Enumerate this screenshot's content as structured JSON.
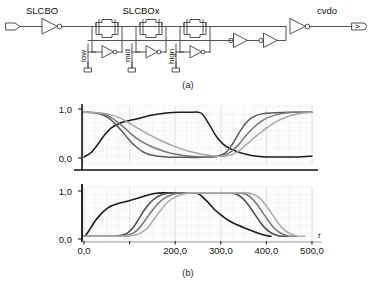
{
  "figure": {
    "panels": [
      {
        "id": "a",
        "caption": "(a)",
        "kind": "circuit-schematic"
      },
      {
        "id": "b",
        "caption": "(b)",
        "kind": "waveform-plots"
      }
    ]
  },
  "circuit": {
    "input_port_label": "SLCBO",
    "internal_net_label": "SLCBOx",
    "output_port_label": "cvdo",
    "control_labels": [
      "low",
      "mid",
      "hign"
    ],
    "stage_count": 3,
    "colors": {
      "wire": "#3a3a3a",
      "symbol": "#4a4a4a",
      "text": "#111111"
    }
  },
  "chart_data": [
    {
      "id": "top",
      "type": "line",
      "title": "",
      "xlabel": "",
      "ylabel": "",
      "xlim": [
        0,
        500
      ],
      "ylim": [
        -0.15,
        1.25
      ],
      "ytick_labels": [
        "1,0",
        "0,0"
      ],
      "ytick_values": [
        1.0,
        0.0
      ],
      "xtick_values": [
        0,
        100,
        200,
        300,
        400,
        500
      ],
      "grid": true,
      "legend": "none",
      "series": [
        {
          "name": "slcbo",
          "color": "#1c1c1c",
          "x": [
            0,
            15,
            30,
            45,
            60,
            80,
            100,
            120,
            150,
            180,
            210,
            240,
            250,
            260,
            275,
            290,
            305,
            320,
            335,
            350,
            370,
            400,
            430,
            470,
            500
          ],
          "y": [
            0.02,
            0.12,
            0.32,
            0.55,
            0.72,
            0.84,
            0.9,
            0.95,
            1.03,
            1.08,
            1.1,
            1.1,
            1.1,
            1.05,
            0.8,
            0.52,
            0.33,
            0.22,
            0.15,
            0.1,
            0.05,
            0.02,
            0.02,
            0.02,
            0.04
          ]
        },
        {
          "name": "cvdo-fast",
          "color": "#595959",
          "x": [
            0,
            20,
            40,
            55,
            70,
            85,
            100,
            115,
            130,
            150,
            180,
            220,
            260,
            290,
            310,
            325,
            340,
            355,
            370,
            390,
            420,
            460,
            500
          ],
          "y": [
            1.1,
            1.09,
            1.04,
            0.95,
            0.8,
            0.62,
            0.42,
            0.26,
            0.14,
            0.06,
            0.02,
            0.01,
            0.01,
            0.03,
            0.12,
            0.32,
            0.6,
            0.84,
            0.98,
            1.06,
            1.09,
            1.1,
            1.1
          ]
        },
        {
          "name": "cvdo-mid",
          "color": "#767676",
          "x": [
            0,
            25,
            45,
            60,
            75,
            90,
            105,
            125,
            150,
            175,
            205,
            240,
            275,
            300,
            320,
            340,
            355,
            372,
            390,
            410,
            440,
            470,
            500
          ],
          "y": [
            1.1,
            1.09,
            1.05,
            0.97,
            0.85,
            0.71,
            0.56,
            0.4,
            0.26,
            0.16,
            0.08,
            0.03,
            0.02,
            0.04,
            0.13,
            0.33,
            0.53,
            0.73,
            0.89,
            1.0,
            1.08,
            1.1,
            1.1
          ]
        },
        {
          "name": "cvdo-slow",
          "color": "#a6a6a6",
          "x": [
            0,
            30,
            50,
            70,
            88,
            105,
            125,
            148,
            172,
            200,
            230,
            262,
            292,
            315,
            335,
            355,
            375,
            398,
            420,
            445,
            472,
            500
          ],
          "y": [
            1.1,
            1.09,
            1.06,
            1.0,
            0.91,
            0.8,
            0.67,
            0.53,
            0.4,
            0.27,
            0.16,
            0.08,
            0.04,
            0.05,
            0.13,
            0.31,
            0.5,
            0.7,
            0.86,
            0.99,
            1.07,
            1.1
          ]
        }
      ]
    },
    {
      "id": "bottom",
      "type": "line",
      "title": "",
      "xlabel": "t",
      "ylabel": "",
      "xlim": [
        0,
        500
      ],
      "ylim": [
        -0.12,
        1.25
      ],
      "ytick_labels": [
        "1,0",
        "0,0"
      ],
      "ytick_values": [
        1.0,
        0.0
      ],
      "xtick_values": [
        0,
        100,
        200,
        300,
        400,
        500
      ],
      "xtick_labels": [
        "0,0",
        "",
        "200,0",
        "300,0",
        "400,0",
        "500,0"
      ],
      "grid": true,
      "legend": "none",
      "series": [
        {
          "name": "slcbo",
          "color": "#1c1c1c",
          "x": [
            0,
            6,
            14,
            24,
            36,
            50,
            62,
            75,
            92,
            110,
            128,
            145,
            158,
            170,
            200,
            240,
            248,
            258,
            272,
            288,
            305,
            320,
            336,
            352,
            368,
            384,
            396,
            404,
            410
          ],
          "y": [
            0.0,
            0.06,
            0.2,
            0.38,
            0.55,
            0.7,
            0.78,
            0.83,
            0.88,
            0.94,
            1.0,
            1.06,
            1.09,
            1.1,
            1.1,
            1.1,
            1.09,
            1.02,
            0.86,
            0.66,
            0.5,
            0.38,
            0.29,
            0.21,
            0.14,
            0.07,
            0.03,
            0.01,
            0.0
          ]
        },
        {
          "name": "sig2",
          "color": "#4f4f4f",
          "x": [
            0,
            60,
            80,
            95,
            108,
            120,
            132,
            145,
            158,
            172,
            190,
            230,
            280,
            320,
            336,
            348,
            360,
            372,
            384,
            396,
            410,
            424,
            436,
            446
          ],
          "y": [
            0.0,
            0.0,
            0.02,
            0.08,
            0.22,
            0.44,
            0.66,
            0.85,
            0.98,
            1.06,
            1.1,
            1.1,
            1.1,
            1.1,
            1.06,
            0.96,
            0.8,
            0.6,
            0.4,
            0.22,
            0.09,
            0.02,
            0.0,
            0.0
          ]
        },
        {
          "name": "sig3",
          "color": "#7a7a7a",
          "x": [
            0,
            70,
            92,
            108,
            122,
            136,
            150,
            164,
            178,
            194,
            212,
            250,
            300,
            340,
            356,
            368,
            380,
            392,
            404,
            416,
            430,
            444,
            456,
            466
          ],
          "y": [
            0.0,
            0.0,
            0.02,
            0.08,
            0.22,
            0.44,
            0.66,
            0.85,
            0.98,
            1.06,
            1.1,
            1.1,
            1.1,
            1.1,
            1.06,
            0.96,
            0.8,
            0.6,
            0.4,
            0.22,
            0.09,
            0.02,
            0.0,
            0.0
          ]
        },
        {
          "name": "sig4",
          "color": "#adadad",
          "x": [
            0,
            82,
            106,
            124,
            140,
            154,
            168,
            182,
            198,
            214,
            234,
            270,
            320,
            356,
            372,
            386,
            398,
            410,
            422,
            434,
            448,
            462,
            474,
            484
          ],
          "y": [
            0.0,
            0.0,
            0.02,
            0.08,
            0.22,
            0.44,
            0.66,
            0.85,
            0.98,
            1.06,
            1.1,
            1.1,
            1.1,
            1.1,
            1.06,
            0.96,
            0.8,
            0.6,
            0.4,
            0.22,
            0.09,
            0.02,
            0.0,
            0.0
          ]
        }
      ]
    }
  ]
}
